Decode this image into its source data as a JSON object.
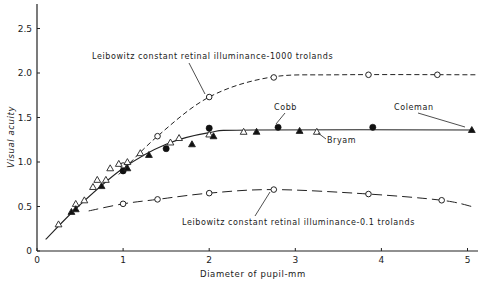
{
  "chart_data": {
    "type": "scatter",
    "title": "",
    "xlabel": "Diameter of pupil-mm",
    "ylabel": "Visual acuity",
    "xlim": [
      0,
      5.2
    ],
    "ylim": [
      0,
      2.8
    ],
    "xticks": [
      "0",
      "1",
      "2",
      "3",
      "4",
      "5"
    ],
    "yticks": [
      "0",
      "0.5",
      "1.0",
      "1.5",
      "2.0",
      "2.5"
    ],
    "grid": false,
    "legend": "none (inline annotations)",
    "series": [
      {
        "name": "Leibowitz constant retinal illuminance-1000 trolands",
        "marker": "open-circle",
        "line": "short-dash",
        "points": [
          [
            1.0,
            0.96
          ],
          [
            1.4,
            1.29
          ],
          [
            2.0,
            1.73
          ],
          [
            2.75,
            1.95
          ],
          [
            3.85,
            1.98
          ],
          [
            4.65,
            1.98
          ]
        ]
      },
      {
        "name": "Leibowitz constant retinal illuminance-0.1 trolands",
        "marker": "open-circle",
        "line": "long-dash",
        "points": [
          [
            1.0,
            0.53
          ],
          [
            1.4,
            0.58
          ],
          [
            2.0,
            0.65
          ],
          [
            2.75,
            0.69
          ],
          [
            3.85,
            0.64
          ],
          [
            4.7,
            0.57
          ]
        ]
      },
      {
        "name": "Cobb",
        "marker": "filled-circle",
        "points": [
          [
            1.0,
            0.9
          ],
          [
            1.5,
            1.15
          ],
          [
            2.0,
            1.38
          ],
          [
            2.8,
            1.39
          ],
          [
            3.9,
            1.39
          ]
        ]
      },
      {
        "name": "Bryam",
        "marker": "open-triangle",
        "points": [
          [
            0.25,
            0.3
          ],
          [
            0.45,
            0.53
          ],
          [
            0.55,
            0.57
          ],
          [
            0.65,
            0.72
          ],
          [
            0.7,
            0.8
          ],
          [
            0.8,
            0.8
          ],
          [
            0.85,
            0.93
          ],
          [
            0.95,
            0.98
          ],
          [
            1.05,
            1.0
          ],
          [
            1.2,
            1.1
          ],
          [
            1.55,
            1.22
          ],
          [
            1.65,
            1.27
          ],
          [
            2.0,
            1.31
          ],
          [
            2.4,
            1.34
          ],
          [
            3.25,
            1.34
          ]
        ]
      },
      {
        "name": "Coleman",
        "marker": "filled-triangle",
        "points": [
          [
            0.4,
            0.44
          ],
          [
            0.45,
            0.47
          ],
          [
            0.75,
            0.73
          ],
          [
            1.05,
            0.93
          ],
          [
            1.3,
            1.08
          ],
          [
            1.8,
            1.2
          ],
          [
            2.05,
            1.29
          ],
          [
            2.55,
            1.34
          ],
          [
            3.05,
            1.35
          ],
          [
            5.05,
            1.36
          ]
        ]
      },
      {
        "name": "fit-curve (solid)",
        "line": "solid",
        "points": [
          [
            0.1,
            0.13
          ],
          [
            0.5,
            0.52
          ],
          [
            1.0,
            0.93
          ],
          [
            1.5,
            1.2
          ],
          [
            2.0,
            1.33
          ],
          [
            2.5,
            1.36
          ],
          [
            5.05,
            1.36
          ]
        ]
      }
    ],
    "annotations": [
      {
        "text": "Leibowitz constant retinal illuminance-1000 trolands",
        "target": [
          2.0,
          1.73
        ]
      },
      {
        "text": "Cobb",
        "target": [
          2.8,
          1.39
        ]
      },
      {
        "text": "Bryam",
        "target": [
          3.25,
          1.34
        ]
      },
      {
        "text": "Coleman",
        "target": [
          5.05,
          1.36
        ]
      },
      {
        "text": "Leibowitz constant retinal illuminance-0.1 trolands",
        "target": [
          2.75,
          0.69
        ]
      }
    ]
  },
  "labels": {
    "xlabel": "Diameter of pupil-mm",
    "ylabel": "Visual acuity",
    "ann_1000": "Leibowitz constant retinal illuminance-1000 trolands",
    "ann_01": "Leibowitz constant retinal illuminance-0.1 trolands",
    "ann_cobb": "Cobb",
    "ann_bryam": "Bryam",
    "ann_coleman": "Coleman"
  }
}
